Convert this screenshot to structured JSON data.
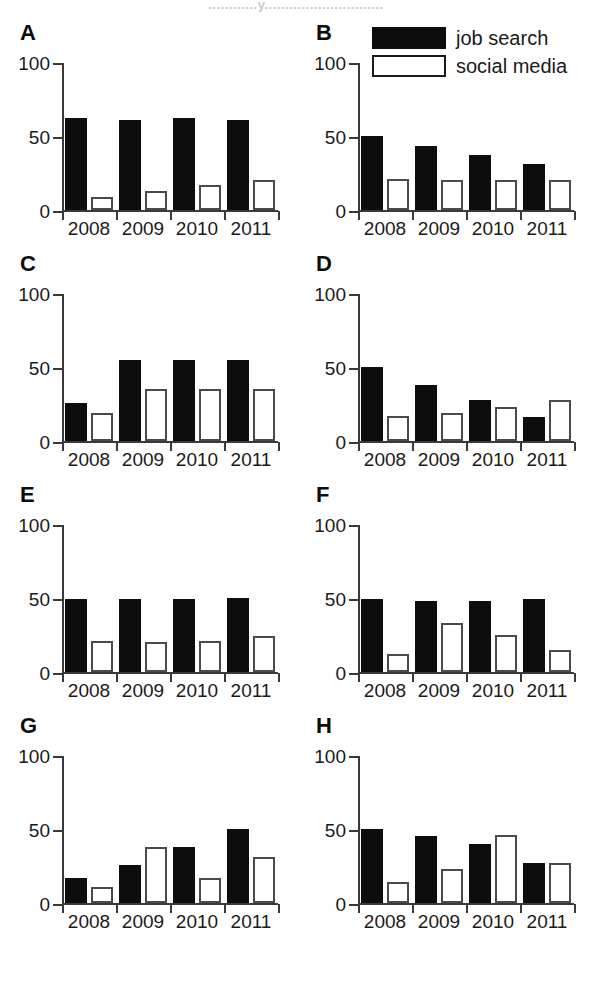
{
  "figure": {
    "cropped_title": "............y.............................",
    "legend": [
      {
        "key": "job_search",
        "label": "job search",
        "style": "filled-black"
      },
      {
        "key": "social_media",
        "label": "social media",
        "style": "white-outline"
      }
    ],
    "axis": {
      "y_ticks": [
        "0",
        "50",
        "100"
      ],
      "y_min": 0,
      "y_max": 100,
      "x_categories": [
        "2008",
        "2009",
        "2010",
        "2011"
      ]
    }
  },
  "chart_data": [
    {
      "type": "bar",
      "panel": "A",
      "title": "",
      "categories": [
        "2008",
        "2009",
        "2010",
        "2011"
      ],
      "series": [
        {
          "name": "job search",
          "values": [
            62,
            61,
            62,
            61
          ]
        },
        {
          "name": "social media",
          "values": [
            9,
            13,
            17,
            20
          ]
        }
      ],
      "xlabel": "",
      "ylabel": "",
      "ylim": [
        0,
        100
      ],
      "grid": false
    },
    {
      "type": "bar",
      "panel": "B",
      "title": "",
      "categories": [
        "2008",
        "2009",
        "2010",
        "2011"
      ],
      "series": [
        {
          "name": "job search",
          "values": [
            50,
            43,
            37,
            31
          ]
        },
        {
          "name": "social media",
          "values": [
            21,
            20,
            20,
            20
          ]
        }
      ],
      "xlabel": "",
      "ylabel": "",
      "ylim": [
        0,
        100
      ],
      "grid": false
    },
    {
      "type": "bar",
      "panel": "C",
      "title": "",
      "categories": [
        "2008",
        "2009",
        "2010",
        "2011"
      ],
      "series": [
        {
          "name": "job search",
          "values": [
            26,
            55,
            55,
            55
          ]
        },
        {
          "name": "social media",
          "values": [
            19,
            35,
            35,
            35
          ]
        }
      ],
      "xlabel": "",
      "ylabel": "",
      "ylim": [
        0,
        100
      ],
      "grid": false
    },
    {
      "type": "bar",
      "panel": "D",
      "title": "",
      "categories": [
        "2008",
        "2009",
        "2010",
        "2011"
      ],
      "series": [
        {
          "name": "job search",
          "values": [
            50,
            38,
            28,
            16
          ]
        },
        {
          "name": "social media",
          "values": [
            17,
            19,
            23,
            28
          ]
        }
      ],
      "xlabel": "",
      "ylabel": "",
      "ylim": [
        0,
        100
      ],
      "grid": false
    },
    {
      "type": "bar",
      "panel": "E",
      "title": "",
      "categories": [
        "2008",
        "2009",
        "2010",
        "2011"
      ],
      "series": [
        {
          "name": "job search",
          "values": [
            49,
            49,
            49,
            50
          ]
        },
        {
          "name": "social media",
          "values": [
            21,
            20,
            21,
            24
          ]
        }
      ],
      "xlabel": "",
      "ylabel": "",
      "ylim": [
        0,
        100
      ],
      "grid": false
    },
    {
      "type": "bar",
      "panel": "F",
      "title": "",
      "categories": [
        "2008",
        "2009",
        "2010",
        "2011"
      ],
      "series": [
        {
          "name": "job search",
          "values": [
            49,
            48,
            48,
            49
          ]
        },
        {
          "name": "social media",
          "values": [
            12,
            33,
            25,
            15
          ]
        }
      ],
      "xlabel": "",
      "ylabel": "",
      "ylim": [
        0,
        100
      ],
      "grid": false
    },
    {
      "type": "bar",
      "panel": "G",
      "title": "",
      "categories": [
        "2008",
        "2009",
        "2010",
        "2011"
      ],
      "series": [
        {
          "name": "job search",
          "values": [
            17,
            26,
            38,
            50
          ]
        },
        {
          "name": "social media",
          "values": [
            11,
            38,
            17,
            31
          ]
        }
      ],
      "xlabel": "",
      "ylabel": "",
      "ylim": [
        0,
        100
      ],
      "grid": false
    },
    {
      "type": "bar",
      "panel": "H",
      "title": "",
      "categories": [
        "2008",
        "2009",
        "2010",
        "2011"
      ],
      "series": [
        {
          "name": "job search",
          "values": [
            50,
            45,
            40,
            27
          ]
        },
        {
          "name": "social media",
          "values": [
            14,
            23,
            46,
            27
          ]
        }
      ],
      "xlabel": "",
      "ylabel": "",
      "ylim": [
        0,
        100
      ],
      "grid": false
    }
  ]
}
